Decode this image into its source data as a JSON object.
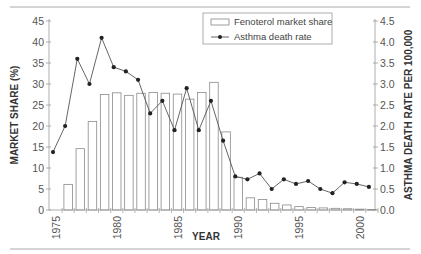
{
  "chart_data": {
    "type": "bar+line",
    "title": "",
    "xlabel": "YEAR",
    "ylabel": "MARKET SHARE (%)",
    "y2label": "ASTHMA DEATH RATE PER 100,000",
    "ylim": [
      0,
      45
    ],
    "y2lim": [
      0,
      4.5
    ],
    "yticks": [
      0,
      5,
      10,
      15,
      20,
      25,
      30,
      35,
      40,
      45
    ],
    "y2ticks": [
      "0.0",
      "0.5",
      "1.0",
      "1.5",
      "2.0",
      "2.5",
      "3.0",
      "3.5",
      "4.0",
      "4.5"
    ],
    "xticks": [
      1975,
      1980,
      1985,
      1990,
      1995,
      2000
    ],
    "grid": false,
    "legend_position": "top-center",
    "series": [
      {
        "name": "Fenoterol market share",
        "type": "bar",
        "axis": "left",
        "x": [
          1976,
          1977,
          1978,
          1979,
          1980,
          1981,
          1982,
          1983,
          1984,
          1985,
          1986,
          1987,
          1988,
          1989,
          1990,
          1991,
          1992,
          1993,
          1994,
          1995,
          1996,
          1997,
          1998,
          1999,
          2000,
          2001
        ],
        "values": [
          6.1,
          14.6,
          21.1,
          27.5,
          27.9,
          27.3,
          27.8,
          28.0,
          27.8,
          27.6,
          26.4,
          28.0,
          30.4,
          18.6,
          7.8,
          2.9,
          2.5,
          1.6,
          1.2,
          0.8,
          0.6,
          0.5,
          0.4,
          0.3,
          0.2,
          0.1
        ]
      },
      {
        "name": "Asthma death rate",
        "type": "line",
        "axis": "right",
        "x": [
          1975,
          1976,
          1977,
          1978,
          1979,
          1980,
          1981,
          1982,
          1983,
          1984,
          1985,
          1986,
          1987,
          1988,
          1989,
          1990,
          1991,
          1992,
          1993,
          1994,
          1995,
          1996,
          1997,
          1998,
          1999,
          2000,
          2001
        ],
        "values": [
          1.38,
          2.0,
          3.6,
          3.0,
          4.1,
          3.4,
          3.3,
          3.1,
          2.3,
          2.6,
          1.9,
          2.9,
          1.9,
          2.6,
          1.65,
          0.8,
          0.73,
          0.87,
          0.5,
          0.73,
          0.62,
          0.69,
          0.5,
          0.4,
          0.66,
          0.62,
          0.55
        ]
      }
    ]
  },
  "legend": {
    "items": [
      {
        "label": "Fenoterol market share",
        "symbol": "open-bar"
      },
      {
        "label": "Asthma death rate",
        "symbol": "line-with-marker"
      }
    ]
  },
  "colors": {
    "axis": "#999999",
    "bar_stroke": "#8a8a8a",
    "bar_fill": "#ffffff",
    "line": "#555555",
    "marker": "#222222",
    "rule": "#aaaaaa"
  }
}
